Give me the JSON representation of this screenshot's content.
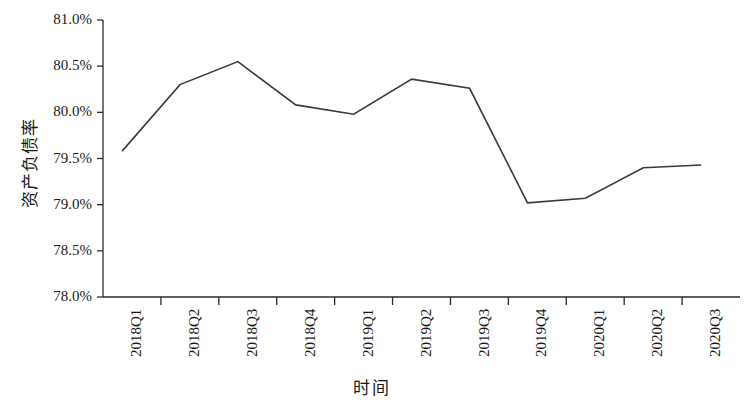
{
  "chart_data": {
    "type": "line",
    "title": "",
    "xlabel": "时间",
    "ylabel": "资产负债率",
    "categories": [
      "2018Q1",
      "2018Q2",
      "2018Q3",
      "2018Q4",
      "2019Q1",
      "2019Q2",
      "2019Q3",
      "2019Q4",
      "2020Q1",
      "2020Q2",
      "2020Q3"
    ],
    "values": [
      79.58,
      80.3,
      80.55,
      80.08,
      79.98,
      80.36,
      80.26,
      79.02,
      79.07,
      79.4,
      79.43
    ],
    "value_unit": "%",
    "series": [
      {
        "name": "资产负债率",
        "values": [
          79.58,
          80.3,
          80.55,
          80.08,
          79.98,
          80.36,
          80.26,
          79.02,
          79.07,
          79.4,
          79.43
        ],
        "color": "#3a3a3a"
      }
    ],
    "ylim": [
      78.0,
      81.0
    ],
    "ytick_values": [
      81.0,
      80.5,
      80.0,
      79.5,
      79.0,
      78.5,
      78.0
    ],
    "ytick_labels": [
      "81.0%",
      "80.5%",
      "80.0%",
      "79.5%",
      "79.0%",
      "78.5%",
      "78.0%"
    ],
    "grid": false,
    "legend": null,
    "legend_position": "none",
    "line_color": "#3a3a3a",
    "axis_color": "#2b2b2b",
    "background": "#ffffff"
  }
}
